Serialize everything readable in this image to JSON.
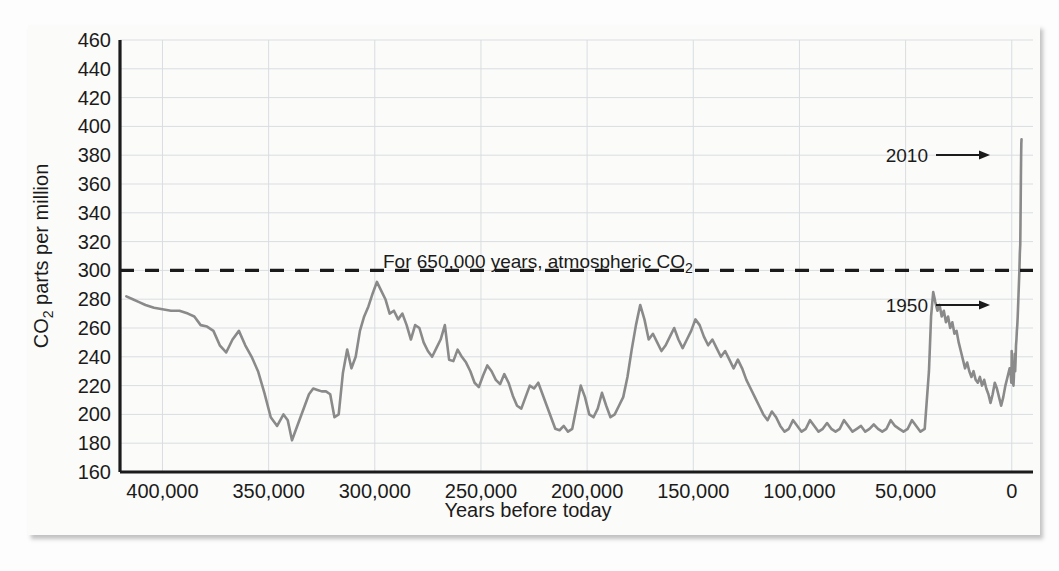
{
  "figure": {
    "background_color": "#fdfdfd",
    "panel_color": "#fbfbfa",
    "axis_color": "#1b1b1b",
    "grid_color": "#d9dde0",
    "series_color": "#8a8a8a",
    "threshold_color": "#1b1b1b"
  },
  "chart_data": {
    "type": "line",
    "title": "",
    "xlabel": "Years before today",
    "ylabel": "CO2 parts per million",
    "ylabel_main": "CO",
    "ylabel_sub": "2",
    "ylabel_rest": " parts per million",
    "xlim": [
      420000,
      -10000
    ],
    "ylim": [
      160,
      460
    ],
    "x_inverted": true,
    "grid": true,
    "legend": false,
    "xticks": [
      400000,
      350000,
      300000,
      250000,
      200000,
      150000,
      100000,
      50000,
      0
    ],
    "xtick_labels": [
      "400,000",
      "350,000",
      "300,000",
      "250,000",
      "200,000",
      "150,000",
      "100,000",
      "50,000",
      "0"
    ],
    "yticks": [
      160,
      180,
      200,
      220,
      240,
      260,
      280,
      300,
      320,
      340,
      360,
      380,
      400,
      420,
      440,
      460
    ],
    "ytick_labels": [
      "160",
      "180",
      "200",
      "220",
      "240",
      "260",
      "280",
      "300",
      "320",
      "340",
      "360",
      "380",
      "400",
      "420",
      "440",
      "460"
    ],
    "annotations": [
      {
        "id": "threshold-note",
        "text": "For 650,000 years, atmospheric CO",
        "text_sub": "2",
        "full_text": "For 650,000 years, atmospheric CO2",
        "type": "dashed-threshold-label",
        "y_value": 300
      },
      {
        "id": "arrow-2010",
        "text": "2010",
        "type": "arrow",
        "y_value": 390,
        "x_value": 0
      },
      {
        "id": "arrow-1950",
        "text": "1950",
        "type": "arrow",
        "y_value": 310,
        "x_value": 0
      }
    ],
    "threshold_line": {
      "value": 300,
      "style": "dashed",
      "label": "For 650,000 years, atmospheric CO2 never exceeded 300 ppm"
    },
    "series": [
      {
        "name": "Atmospheric CO2 (ice core record)",
        "color": "#8a8a8a",
        "points": [
          [
            417000,
            282
          ],
          [
            414000,
            280
          ],
          [
            411000,
            278
          ],
          [
            408000,
            276
          ],
          [
            404000,
            274
          ],
          [
            400000,
            273
          ],
          [
            396000,
            272
          ],
          [
            392000,
            272
          ],
          [
            388000,
            270
          ],
          [
            385000,
            268
          ],
          [
            382000,
            262
          ],
          [
            379000,
            261
          ],
          [
            376000,
            258
          ],
          [
            373000,
            248
          ],
          [
            370000,
            243
          ],
          [
            367000,
            252
          ],
          [
            364000,
            258
          ],
          [
            361000,
            248
          ],
          [
            358000,
            240
          ],
          [
            355000,
            230
          ],
          [
            352000,
            215
          ],
          [
            349000,
            198
          ],
          [
            346000,
            192
          ],
          [
            343000,
            200
          ],
          [
            341000,
            196
          ],
          [
            339000,
            182
          ],
          [
            337000,
            190
          ],
          [
            335000,
            198
          ],
          [
            333000,
            206
          ],
          [
            331000,
            214
          ],
          [
            329000,
            218
          ],
          [
            327000,
            217
          ],
          [
            325000,
            216
          ],
          [
            323000,
            216
          ],
          [
            321000,
            214
          ],
          [
            319000,
            198
          ],
          [
            317000,
            200
          ],
          [
            315000,
            229
          ],
          [
            313000,
            245
          ],
          [
            311000,
            232
          ],
          [
            309000,
            240
          ],
          [
            307000,
            258
          ],
          [
            305000,
            268
          ],
          [
            303000,
            275
          ],
          [
            301000,
            284
          ],
          [
            299000,
            292
          ],
          [
            297000,
            286
          ],
          [
            295000,
            280
          ],
          [
            293000,
            270
          ],
          [
            291000,
            272
          ],
          [
            289000,
            266
          ],
          [
            287000,
            270
          ],
          [
            285000,
            262
          ],
          [
            283000,
            252
          ],
          [
            281000,
            262
          ],
          [
            279000,
            260
          ],
          [
            277000,
            250
          ],
          [
            275000,
            244
          ],
          [
            273000,
            240
          ],
          [
            271000,
            246
          ],
          [
            269000,
            252
          ],
          [
            267000,
            262
          ],
          [
            265000,
            238
          ],
          [
            263000,
            237
          ],
          [
            261000,
            245
          ],
          [
            259000,
            240
          ],
          [
            257000,
            236
          ],
          [
            255000,
            230
          ],
          [
            253000,
            222
          ],
          [
            251000,
            219
          ],
          [
            249000,
            227
          ],
          [
            247000,
            234
          ],
          [
            245000,
            230
          ],
          [
            243000,
            224
          ],
          [
            241000,
            221
          ],
          [
            239000,
            228
          ],
          [
            237000,
            222
          ],
          [
            235000,
            213
          ],
          [
            233000,
            206
          ],
          [
            231000,
            204
          ],
          [
            229000,
            212
          ],
          [
            227000,
            220
          ],
          [
            225000,
            218
          ],
          [
            223000,
            222
          ],
          [
            221000,
            214
          ],
          [
            219000,
            206
          ],
          [
            217000,
            198
          ],
          [
            215000,
            190
          ],
          [
            213000,
            189
          ],
          [
            211000,
            192
          ],
          [
            209000,
            188
          ],
          [
            207000,
            190
          ],
          [
            205000,
            205
          ],
          [
            203000,
            220
          ],
          [
            201000,
            212
          ],
          [
            199000,
            200
          ],
          [
            197000,
            198
          ],
          [
            195000,
            204
          ],
          [
            193000,
            215
          ],
          [
            191000,
            206
          ],
          [
            189000,
            198
          ],
          [
            187000,
            200
          ],
          [
            185000,
            206
          ],
          [
            183000,
            212
          ],
          [
            181000,
            226
          ],
          [
            179000,
            245
          ],
          [
            177000,
            262
          ],
          [
            175000,
            276
          ],
          [
            173000,
            266
          ],
          [
            171000,
            252
          ],
          [
            169000,
            256
          ],
          [
            167000,
            250
          ],
          [
            165000,
            244
          ],
          [
            163000,
            248
          ],
          [
            161000,
            254
          ],
          [
            159000,
            260
          ],
          [
            157000,
            252
          ],
          [
            155000,
            246
          ],
          [
            153000,
            252
          ],
          [
            151000,
            258
          ],
          [
            149000,
            266
          ],
          [
            147000,
            262
          ],
          [
            145000,
            254
          ],
          [
            143000,
            248
          ],
          [
            141000,
            252
          ],
          [
            139000,
            246
          ],
          [
            137000,
            240
          ],
          [
            135000,
            244
          ],
          [
            133000,
            238
          ],
          [
            131000,
            232
          ],
          [
            129000,
            238
          ],
          [
            127000,
            232
          ],
          [
            125000,
            224
          ],
          [
            123000,
            218
          ],
          [
            121000,
            212
          ],
          [
            119000,
            206
          ],
          [
            117000,
            200
          ],
          [
            115000,
            196
          ],
          [
            113000,
            202
          ],
          [
            111000,
            198
          ],
          [
            109000,
            192
          ],
          [
            107000,
            188
          ],
          [
            105000,
            190
          ],
          [
            103000,
            196
          ],
          [
            101000,
            192
          ],
          [
            99000,
            188
          ],
          [
            97000,
            190
          ],
          [
            95000,
            196
          ],
          [
            93000,
            192
          ],
          [
            91000,
            188
          ],
          [
            89000,
            190
          ],
          [
            87000,
            194
          ],
          [
            85000,
            190
          ],
          [
            83000,
            188
          ],
          [
            81000,
            190
          ],
          [
            79000,
            196
          ],
          [
            77000,
            192
          ],
          [
            75000,
            188
          ],
          [
            73000,
            190
          ],
          [
            71000,
            192
          ],
          [
            69000,
            188
          ],
          [
            67000,
            190
          ],
          [
            65000,
            193
          ],
          [
            63000,
            190
          ],
          [
            61000,
            188
          ],
          [
            59000,
            190
          ],
          [
            57000,
            196
          ],
          [
            55000,
            192
          ],
          [
            53000,
            190
          ],
          [
            51000,
            188
          ],
          [
            49000,
            190
          ],
          [
            47000,
            196
          ],
          [
            45000,
            192
          ],
          [
            43000,
            188
          ],
          [
            41000,
            190
          ],
          [
            39000,
            230
          ],
          [
            38000,
            268
          ],
          [
            37000,
            285
          ],
          [
            36000,
            278
          ],
          [
            35000,
            272
          ],
          [
            34000,
            276
          ],
          [
            33000,
            268
          ],
          [
            32000,
            272
          ],
          [
            31000,
            264
          ],
          [
            30000,
            268
          ],
          [
            29000,
            260
          ],
          [
            28000,
            264
          ],
          [
            27000,
            256
          ],
          [
            26000,
            258
          ],
          [
            25000,
            250
          ],
          [
            24000,
            244
          ],
          [
            23000,
            238
          ],
          [
            22000,
            232
          ],
          [
            21000,
            236
          ],
          [
            20000,
            230
          ],
          [
            19000,
            226
          ],
          [
            18000,
            230
          ],
          [
            17000,
            224
          ],
          [
            16000,
            222
          ],
          [
            15000,
            226
          ],
          [
            14000,
            220
          ],
          [
            13000,
            224
          ],
          [
            12000,
            218
          ],
          [
            11000,
            214
          ],
          [
            10000,
            208
          ],
          [
            9000,
            214
          ],
          [
            8000,
            222
          ],
          [
            7000,
            218
          ],
          [
            6000,
            212
          ],
          [
            5000,
            206
          ],
          [
            4000,
            212
          ],
          [
            3000,
            220
          ],
          [
            2000,
            226
          ],
          [
            1000,
            232
          ],
          [
            500,
            228
          ],
          [
            200,
            222
          ],
          [
            100,
            230
          ],
          [
            60,
            238
          ],
          [
            30,
            244
          ],
          [
            10,
            240
          ],
          [
            0,
            236
          ],
          [
            -200,
            232
          ],
          [
            -400,
            226
          ],
          [
            -600,
            222
          ],
          [
            -800,
            220
          ],
          [
            -1000,
            226
          ],
          [
            -1200,
            236
          ],
          [
            -1400,
            242
          ],
          [
            -1600,
            230
          ],
          [
            -1800,
            238
          ],
          [
            -2000,
            248
          ],
          [
            -2200,
            252
          ],
          [
            -2400,
            258
          ],
          [
            -2600,
            262
          ],
          [
            -2800,
            268
          ],
          [
            -3000,
            276
          ],
          [
            -3200,
            284
          ],
          [
            -3400,
            292
          ],
          [
            -3600,
            300
          ],
          [
            -3800,
            312
          ],
          [
            -4000,
            318
          ],
          [
            -4100,
            332
          ],
          [
            -4200,
            348
          ],
          [
            -4300,
            364
          ],
          [
            -4400,
            378
          ],
          [
            -4500,
            388
          ],
          [
            -4600,
            391
          ]
        ]
      }
    ]
  }
}
